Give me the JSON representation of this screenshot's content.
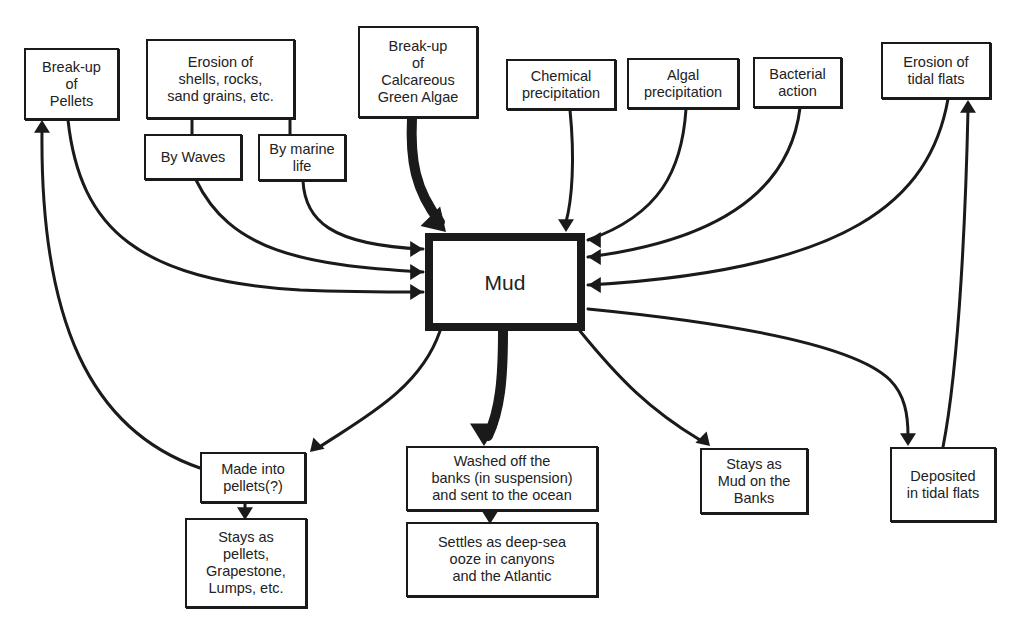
{
  "diagram": {
    "center": {
      "id": "mud",
      "label": "Mud",
      "x": 425,
      "y": 233,
      "w": 160,
      "h": 98
    },
    "nodes": [
      {
        "id": "breakup-pellets",
        "label": "Break-up\nof\nPellets",
        "x": 24,
        "y": 48,
        "w": 95,
        "h": 72
      },
      {
        "id": "erosion-shells",
        "label": "Erosion of\nshells, rocks,\nsand grains, etc.",
        "x": 146,
        "y": 39,
        "w": 149,
        "h": 80
      },
      {
        "id": "by-waves",
        "label": "By Waves",
        "x": 144,
        "y": 134,
        "w": 98,
        "h": 46
      },
      {
        "id": "by-marine-life",
        "label": "By marine\nlife",
        "x": 258,
        "y": 134,
        "w": 88,
        "h": 47
      },
      {
        "id": "breakup-algae",
        "label": "Break-up\nof\nCalcareous\nGreen Algae",
        "x": 358,
        "y": 26,
        "w": 120,
        "h": 92
      },
      {
        "id": "chemical-precip",
        "label": "Chemical\nprecipitation",
        "x": 506,
        "y": 59,
        "w": 110,
        "h": 51
      },
      {
        "id": "algal-precip",
        "label": "Algal\nprecipitation",
        "x": 627,
        "y": 58,
        "w": 112,
        "h": 51
      },
      {
        "id": "bacterial-action",
        "label": "Bacterial\naction",
        "x": 753,
        "y": 57,
        "w": 89,
        "h": 51
      },
      {
        "id": "erosion-tidal",
        "label": "Erosion of\ntidal flats",
        "x": 881,
        "y": 42,
        "w": 110,
        "h": 57
      },
      {
        "id": "made-into-pellets",
        "label": "Made into\npellets(?)",
        "x": 200,
        "y": 452,
        "w": 106,
        "h": 51
      },
      {
        "id": "stays-pellets",
        "label": "Stays as\npellets,\nGrapestone,\nLumps, etc.",
        "x": 185,
        "y": 518,
        "w": 122,
        "h": 90
      },
      {
        "id": "washed-off",
        "label": "Washed off the\nbanks (in suspension)\nand sent to the ocean",
        "x": 406,
        "y": 446,
        "w": 192,
        "h": 65
      },
      {
        "id": "settles-ooze",
        "label": "Settles as deep-sea\nooze in canyons\nand the Atlantic",
        "x": 406,
        "y": 522,
        "w": 192,
        "h": 75
      },
      {
        "id": "stays-mud-banks",
        "label": "Stays as\nMud on the\nBanks",
        "x": 700,
        "y": 448,
        "w": 108,
        "h": 66
      },
      {
        "id": "deposited-tidal",
        "label": "Deposited\nin tidal flats",
        "x": 890,
        "y": 447,
        "w": 106,
        "h": 75
      }
    ],
    "edges": [
      {
        "from": "breakup-pellets",
        "to": "mud",
        "d": "M68,120 C80,230 140,280 300,290 C350,292 390,292 423,292",
        "width": 3,
        "head": [
          423,
          292,
          "right"
        ]
      },
      {
        "from": "by-waves",
        "to": "mud",
        "d": "M196,180 C230,250 300,265 423,272",
        "width": 3,
        "head": [
          423,
          272,
          "right"
        ]
      },
      {
        "from": "by-marine-life",
        "to": "mud",
        "d": "M303,181 C305,220 330,245 423,249",
        "width": 3,
        "head": [
          423,
          249,
          "right"
        ]
      },
      {
        "from": "breakup-algae",
        "to": "mud",
        "d": "M412,118 C410,160 415,190 440,222",
        "width": 10,
        "head": [
          446,
          232,
          "down-right-big"
        ]
      },
      {
        "from": "chemical-precip",
        "to": "mud",
        "d": "M570,110 C575,160 572,200 566,222",
        "width": 3,
        "head": [
          566,
          232,
          "down"
        ]
      },
      {
        "from": "algal-precip",
        "to": "mud",
        "d": "M686,109 C682,170 660,215 588,240",
        "width": 3,
        "head": [
          588,
          240,
          "left"
        ]
      },
      {
        "from": "bacterial-action",
        "to": "mud",
        "d": "M800,108 C790,190 720,240 588,257",
        "width": 3,
        "head": [
          588,
          257,
          "left"
        ]
      },
      {
        "from": "erosion-tidal",
        "to": "mud",
        "d": "M948,99 C930,200 850,270 588,285",
        "width": 3,
        "head": [
          588,
          285,
          "left"
        ]
      },
      {
        "from": "mud",
        "to": "made-into-pellets",
        "d": "M440,331 C420,390 360,420 318,448",
        "width": 3,
        "head": [
          310,
          452,
          "down-left"
        ]
      },
      {
        "from": "made-into-pellets",
        "to": "breakup-pellets",
        "d": "M200,468 C90,430 40,320 42,130",
        "width": 3,
        "head": [
          42,
          120,
          "up"
        ]
      },
      {
        "from": "mud",
        "to": "washed-off",
        "d": "M503,331 C503,380 500,410 488,436",
        "width": 10,
        "head": [
          484,
          446,
          "down-big"
        ]
      },
      {
        "from": "mud",
        "to": "stays-mud-banks",
        "d": "M580,331 C620,380 650,410 700,440",
        "width": 3,
        "head": [
          710,
          446,
          "down-right"
        ]
      },
      {
        "from": "mud",
        "to": "deposited-tidal",
        "d": "M588,309 C700,320 850,340 890,380 C905,395 908,415 908,436",
        "width": 3,
        "head": [
          908,
          446,
          "down"
        ]
      },
      {
        "from": "deposited-tidal",
        "to": "erosion-tidal",
        "d": "M943,447 C960,360 966,200 968,110",
        "width": 3,
        "head": [
          968,
          100,
          "up"
        ]
      },
      {
        "from": "made-into-pellets",
        "to": "stays-pellets",
        "d": "M245,503 L245,512",
        "width": 3,
        "head": [
          245,
          520,
          "down"
        ]
      },
      {
        "from": "washed-off",
        "to": "settles-ooze",
        "d": "M490,511 L490,516",
        "width": 3,
        "head": [
          490,
          524,
          "down"
        ]
      }
    ],
    "connectors": [
      {
        "from": "erosion-shells",
        "to": "by-waves",
        "d": "M192,119 L192,134"
      },
      {
        "from": "erosion-shells",
        "to": "by-marine-life",
        "d": "M290,119 L290,134"
      }
    ]
  }
}
